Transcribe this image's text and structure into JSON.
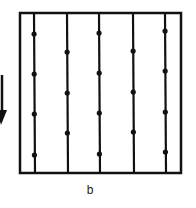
{
  "diagram": {
    "caption": "b",
    "arrow": {
      "direction": "down",
      "icon": "arrow-down-icon"
    },
    "frame": {
      "x": 20,
      "y": 13,
      "width": 161,
      "height": 160
    },
    "lines": [
      {
        "x": 34,
        "dots": [
          34,
          74,
          114,
          155
        ]
      },
      {
        "x": 67,
        "dots": [
          52,
          93,
          133
        ]
      },
      {
        "x": 99,
        "dots": [
          33,
          73,
          113,
          154
        ]
      },
      {
        "x": 133,
        "dots": [
          51,
          92,
          132
        ]
      },
      {
        "x": 165,
        "dots": [
          31,
          71,
          112,
          152
        ]
      }
    ],
    "colors": {
      "stroke": "#111111",
      "background": "#ffffff"
    }
  }
}
